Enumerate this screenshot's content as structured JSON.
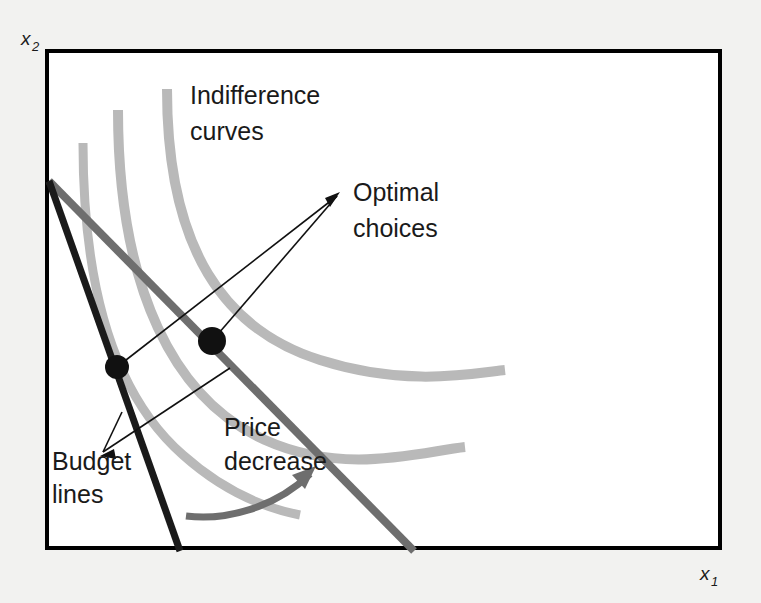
{
  "figure": {
    "title_implicit": "Price decrease and optimal choice",
    "background_color": "#f2f2f0",
    "plot_background_color": "#ffffff",
    "frame_color": "#000000"
  },
  "axes": {
    "y_label": "x",
    "y_sub": "2",
    "x_label": "x",
    "x_sub": "1"
  },
  "annotations": {
    "indifference": {
      "line1": "Indifference",
      "line2": "curves"
    },
    "optimal": {
      "line1": "Optimal",
      "line2": "choices"
    },
    "budget": {
      "line1": "Budget",
      "line2": "lines"
    },
    "price": {
      "line1": "Price",
      "line2": "decrease"
    }
  },
  "colors": {
    "indifference_curve": "#b9b9b9",
    "budget_line_initial": "#1a1a1a",
    "budget_line_new": "#6e6e6e",
    "optimal_point": "#111111",
    "leader_line": "#1a1a1a",
    "price_arrow": "#6e6e6e"
  },
  "chart_data": {
    "type": "line",
    "title": "",
    "xlabel": "x1",
    "ylabel": "x2",
    "grid": false,
    "legend": "none",
    "plot_frame": {
      "x0": 47,
      "y0": 51,
      "x1": 720,
      "y1": 548
    },
    "indifference_curves": [
      {
        "name": "IC1-lowest",
        "color": "#b9b9b9",
        "width": 9,
        "path": "M 83 143 C 83 300, 120 400, 183 455 C 230 497, 275 510, 300 515"
      },
      {
        "name": "IC2-middle",
        "color": "#b9b9b9",
        "width": 10,
        "path": "M 118 110 C 118 290, 175 400, 265 440 C 345 476, 420 452, 465 447"
      },
      {
        "name": "IC3-highest",
        "color": "#b9b9b9",
        "width": 10,
        "path": "M 167 89 C 167 250, 225 330, 320 360 C 405 387, 470 374, 505 370"
      }
    ],
    "budget_lines": [
      {
        "name": "initial-budget-line",
        "color": "#1a1a1a",
        "width": 7,
        "from": [
          49,
          181
        ],
        "to": [
          180,
          551
        ],
        "slope_desc": "steep"
      },
      {
        "name": "new-budget-line-after-price-decrease",
        "color": "#6e6e6e",
        "width": 8,
        "from": [
          49,
          181
        ],
        "to": [
          414,
          551
        ],
        "slope_desc": "flatter"
      }
    ],
    "optimal_points": [
      {
        "name": "optimal-choice-initial",
        "x": 117,
        "y": 367,
        "r": 12
      },
      {
        "name": "optimal-choice-new",
        "x": 212,
        "y": 341,
        "r": 14
      }
    ],
    "leader_lines": {
      "optimal": [
        {
          "from": [
            117,
            367
          ],
          "to": [
            337,
            196
          ]
        },
        {
          "from": [
            212,
            341
          ],
          "to": [
            337,
            196
          ]
        }
      ],
      "budget": [
        {
          "from": [
            122,
            412
          ],
          "to": [
            103,
            452
          ]
        },
        {
          "from": [
            230,
            368
          ],
          "to": [
            103,
            452
          ]
        }
      ]
    },
    "price_decrease_arrow": {
      "path": "M 186 516 C 225 521, 275 508, 310 474",
      "color": "#6e6e6e",
      "width": 7,
      "head_at": [
        313,
        470
      ]
    },
    "text_positions": {
      "indifference": [
        190,
        105
      ],
      "optimal": [
        353,
        201
      ],
      "budget": [
        52,
        469
      ],
      "price": [
        224,
        437
      ],
      "y_axis": [
        21,
        45
      ],
      "x_axis": [
        700,
        580
      ]
    }
  }
}
